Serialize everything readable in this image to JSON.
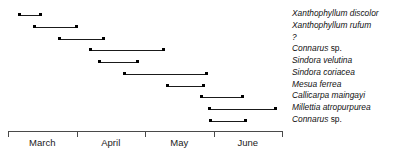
{
  "chart_data": {
    "type": "bar",
    "orientation": "horizontal",
    "title": "",
    "xlabel": "",
    "ylabel": "",
    "grid": false,
    "legend_position": "right",
    "axis": {
      "tick_labels": [
        "March",
        "April",
        "May",
        "June"
      ],
      "xlim": [
        0,
        4
      ],
      "unit": "month"
    },
    "categories": [
      "Xanthophyllum discolor",
      "Xanthophyllum rufum",
      "?",
      "Connarus sp.",
      "Sindora velutina",
      "Sindora coriacea",
      "Mesua ferrea",
      "Callicarpa maingayi",
      "Millettia atropurpurea",
      "Connarus sp."
    ],
    "bars": [
      {
        "label": "Xanthophyllum discolor",
        "genus": "Xanthophyllum discolor",
        "qualifier": "",
        "start": 0.15,
        "end": 0.5
      },
      {
        "label": "Xanthophyllum rufum",
        "genus": "Xanthophyllum rufum",
        "qualifier": "",
        "start": 0.37,
        "end": 1.02
      },
      {
        "label": "?",
        "genus": "?",
        "qualifier": "",
        "start": 0.73,
        "end": 1.42
      },
      {
        "label": "Connarus sp.",
        "genus": "Connarus",
        "qualifier": " sp.",
        "start": 1.18,
        "end": 2.29
      },
      {
        "label": "Sindora velutina",
        "genus": "Sindora velutina",
        "qualifier": "",
        "start": 1.31,
        "end": 1.91
      },
      {
        "label": "Sindora coriacea",
        "genus": "Sindora coriacea",
        "qualifier": "",
        "start": 1.68,
        "end": 2.92
      },
      {
        "label": "Mesua ferrea",
        "genus": "Mesua ferrea",
        "qualifier": "",
        "start": 2.31,
        "end": 2.88
      },
      {
        "label": "Callicarpa maingayi",
        "genus": "Callicarpa maingayi",
        "qualifier": "",
        "start": 2.8,
        "end": 3.44
      },
      {
        "label": "Millettia atropurpurea",
        "genus": "Millettia atropurpurea",
        "qualifier": "",
        "start": 2.92,
        "end": 3.93
      },
      {
        "label": "Connarus sp.",
        "genus": "Connarus",
        "qualifier": " sp.",
        "start": 2.93,
        "end": 3.49
      }
    ]
  },
  "colors": {
    "bar": "#1a1a1a",
    "axis": "#4a4a4a",
    "text": "#111111",
    "background": "#ffffff"
  }
}
